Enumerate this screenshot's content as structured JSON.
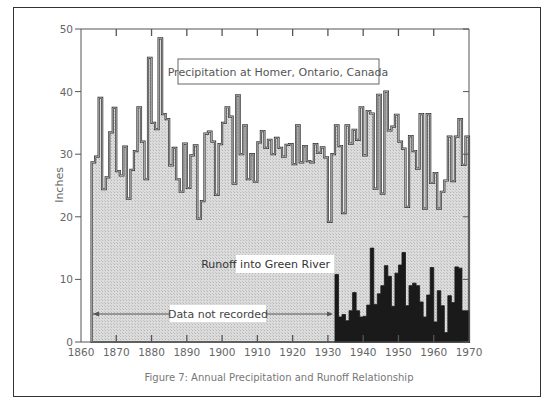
{
  "chart_data": {
    "type": "bar",
    "title": "Figure 7: Annual Precipitation and Runoff Relationship",
    "xlabel": "",
    "ylabel": "Inches",
    "xlim": [
      1860,
      1970
    ],
    "ylim": [
      0,
      50
    ],
    "x_ticks": [
      1860,
      1870,
      1880,
      1890,
      1900,
      1910,
      1920,
      1930,
      1940,
      1950,
      1960,
      1970
    ],
    "y_ticks": [
      0,
      10,
      20,
      30,
      40,
      50
    ],
    "grid": false,
    "legend": "none (inline labels)",
    "annotations": [
      "Precipitation at Homer, Ontario, Canada",
      "Runoff into Green River",
      "Data not recorded"
    ],
    "series": [
      {
        "name": "Precipitation at Homer, Ontario, Canada",
        "style": "step, light stippled fill",
        "start_year": 1863,
        "values": [
          28.7,
          29.6,
          39,
          24.4,
          26.3,
          33.5,
          37.4,
          27.3,
          26.6,
          31.2,
          22.9,
          27.5,
          30.5,
          37.5,
          32,
          26,
          45.4,
          35,
          34,
          48.5,
          36.4,
          35.6,
          28.2,
          31,
          26,
          24,
          31.7,
          24.6,
          29.8,
          31.4,
          19.7,
          22.5,
          33.3,
          33.6,
          32,
          23.5,
          31.6,
          35,
          37.5,
          36,
          25.3,
          39.4,
          30,
          34.6,
          26,
          30,
          25.6,
          31.9,
          33.7,
          31,
          32.3,
          30,
          32.6,
          31,
          29.6,
          31.5,
          31.6,
          28.4,
          34.6,
          28.7,
          31.3,
          28.9,
          28.7,
          31.6,
          30.2,
          31.1,
          29.5,
          19.2,
          30,
          34.6,
          31.3,
          20.6,
          34.6,
          31.7,
          33.9,
          32.3,
          37.5,
          29.8,
          36.9,
          36.5,
          24.5,
          39.5,
          23.7,
          40,
          33.8,
          34.4,
          36.3,
          32,
          30.9,
          21.6,
          32.9,
          30.5,
          27.7,
          36.4,
          21.3,
          36.4,
          25.4,
          27,
          21.3,
          24,
          25.8,
          32.8,
          25.7,
          32.8,
          35.6,
          28.3,
          32.8
        ]
      },
      {
        "name": "Runoff into Green River",
        "style": "step, solid black fill",
        "start_year": 1932,
        "values": [
          10.8,
          4,
          4.4,
          3.4,
          5,
          7.9,
          5,
          4,
          4.1,
          5.9,
          15,
          6,
          7.7,
          9,
          12.2,
          10.5,
          5.7,
          11,
          12.3,
          14.3,
          5.8,
          9,
          9.4,
          9,
          6.4,
          4,
          7.5,
          11.9,
          3.2,
          8.2,
          5.8,
          1.5,
          7.4,
          6.3,
          12,
          11.8,
          5,
          5
        ]
      }
    ],
    "no_data_range": [
      1863,
      1932
    ]
  },
  "labels": {
    "precip_title": "Precipitation at Homer, Ontario, Canada",
    "runoff_label": "Runoff into Green River",
    "no_data_label": "Data not recorded",
    "y_axis_label": "Inches",
    "caption": "Figure 7: Annual Precipitation and Runoff Relationship"
  },
  "colors": {
    "precip_fill": "#d9d9d9",
    "precip_line": "#333333",
    "runoff_fill": "#1a1a1a",
    "axis": "#555555"
  }
}
